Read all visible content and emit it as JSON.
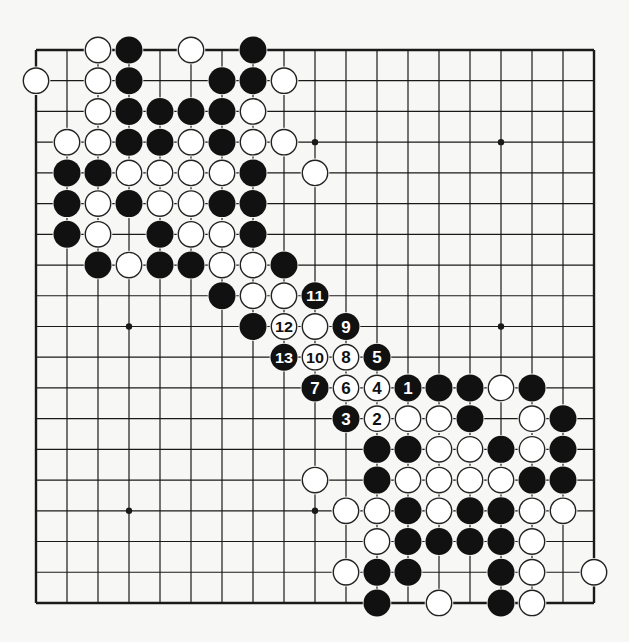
{
  "diagram": {
    "type": "go-board",
    "size": 19,
    "origin": {
      "x": 36,
      "y": 50
    },
    "spacing": {
      "x": 31.0,
      "y": 30.72
    },
    "stone_radius": 13.5,
    "colors": {
      "background": "#f7f7f5",
      "line": "#1a1a1a",
      "black_stone": "#111111",
      "white_stone": "#ffffff",
      "stone_outline": "#222222"
    },
    "star_points": [
      [
        3,
        3
      ],
      [
        9,
        3
      ],
      [
        15,
        3
      ],
      [
        3,
        9
      ],
      [
        9,
        9
      ],
      [
        15,
        9
      ],
      [
        3,
        15
      ],
      [
        9,
        15
      ],
      [
        15,
        15
      ]
    ],
    "stones": [
      {
        "c": 2,
        "r": 0,
        "color": "white"
      },
      {
        "c": 3,
        "r": 0,
        "color": "black"
      },
      {
        "c": 5,
        "r": 0,
        "color": "white"
      },
      {
        "c": 7,
        "r": 0,
        "color": "black"
      },
      {
        "c": 0,
        "r": 1,
        "color": "white"
      },
      {
        "c": 2,
        "r": 1,
        "color": "white"
      },
      {
        "c": 3,
        "r": 1,
        "color": "black"
      },
      {
        "c": 6,
        "r": 1,
        "color": "black"
      },
      {
        "c": 7,
        "r": 1,
        "color": "black"
      },
      {
        "c": 8,
        "r": 1,
        "color": "white"
      },
      {
        "c": 2,
        "r": 2,
        "color": "white"
      },
      {
        "c": 3,
        "r": 2,
        "color": "black"
      },
      {
        "c": 4,
        "r": 2,
        "color": "black"
      },
      {
        "c": 5,
        "r": 2,
        "color": "black"
      },
      {
        "c": 6,
        "r": 2,
        "color": "black"
      },
      {
        "c": 7,
        "r": 2,
        "color": "white"
      },
      {
        "c": 1,
        "r": 3,
        "color": "white"
      },
      {
        "c": 2,
        "r": 3,
        "color": "white"
      },
      {
        "c": 3,
        "r": 3,
        "color": "black"
      },
      {
        "c": 4,
        "r": 3,
        "color": "black"
      },
      {
        "c": 5,
        "r": 3,
        "color": "white"
      },
      {
        "c": 6,
        "r": 3,
        "color": "black"
      },
      {
        "c": 7,
        "r": 3,
        "color": "white"
      },
      {
        "c": 8,
        "r": 3,
        "color": "white"
      },
      {
        "c": 1,
        "r": 4,
        "color": "black"
      },
      {
        "c": 2,
        "r": 4,
        "color": "black"
      },
      {
        "c": 3,
        "r": 4,
        "color": "white"
      },
      {
        "c": 4,
        "r": 4,
        "color": "white"
      },
      {
        "c": 5,
        "r": 4,
        "color": "white"
      },
      {
        "c": 6,
        "r": 4,
        "color": "white"
      },
      {
        "c": 7,
        "r": 4,
        "color": "black"
      },
      {
        "c": 9,
        "r": 4,
        "color": "white"
      },
      {
        "c": 1,
        "r": 5,
        "color": "black"
      },
      {
        "c": 2,
        "r": 5,
        "color": "white"
      },
      {
        "c": 3,
        "r": 5,
        "color": "black"
      },
      {
        "c": 4,
        "r": 5,
        "color": "white"
      },
      {
        "c": 5,
        "r": 5,
        "color": "white"
      },
      {
        "c": 6,
        "r": 5,
        "color": "black"
      },
      {
        "c": 7,
        "r": 5,
        "color": "black"
      },
      {
        "c": 1,
        "r": 6,
        "color": "black"
      },
      {
        "c": 2,
        "r": 6,
        "color": "white"
      },
      {
        "c": 4,
        "r": 6,
        "color": "black"
      },
      {
        "c": 5,
        "r": 6,
        "color": "white"
      },
      {
        "c": 6,
        "r": 6,
        "color": "white"
      },
      {
        "c": 7,
        "r": 6,
        "color": "black"
      },
      {
        "c": 2,
        "r": 7,
        "color": "black"
      },
      {
        "c": 3,
        "r": 7,
        "color": "white"
      },
      {
        "c": 4,
        "r": 7,
        "color": "black"
      },
      {
        "c": 5,
        "r": 7,
        "color": "black"
      },
      {
        "c": 6,
        "r": 7,
        "color": "white"
      },
      {
        "c": 7,
        "r": 7,
        "color": "white"
      },
      {
        "c": 8,
        "r": 7,
        "color": "black"
      },
      {
        "c": 6,
        "r": 8,
        "color": "black"
      },
      {
        "c": 7,
        "r": 8,
        "color": "white"
      },
      {
        "c": 8,
        "r": 8,
        "color": "white"
      },
      {
        "c": 9,
        "r": 8,
        "color": "black",
        "label": "11"
      },
      {
        "c": 7,
        "r": 9,
        "color": "black"
      },
      {
        "c": 8,
        "r": 9,
        "color": "white",
        "label": "12"
      },
      {
        "c": 9,
        "r": 9,
        "color": "white"
      },
      {
        "c": 10,
        "r": 9,
        "color": "black",
        "label": "9"
      },
      {
        "c": 8,
        "r": 10,
        "color": "black",
        "label": "13"
      },
      {
        "c": 9,
        "r": 10,
        "color": "white",
        "label": "10"
      },
      {
        "c": 10,
        "r": 10,
        "color": "white",
        "label": "8"
      },
      {
        "c": 11,
        "r": 10,
        "color": "black",
        "label": "5"
      },
      {
        "c": 9,
        "r": 11,
        "color": "black",
        "label": "7"
      },
      {
        "c": 10,
        "r": 11,
        "color": "white",
        "label": "6"
      },
      {
        "c": 11,
        "r": 11,
        "color": "white",
        "label": "4"
      },
      {
        "c": 12,
        "r": 11,
        "color": "black",
        "label": "1"
      },
      {
        "c": 13,
        "r": 11,
        "color": "black"
      },
      {
        "c": 14,
        "r": 11,
        "color": "black"
      },
      {
        "c": 15,
        "r": 11,
        "color": "white"
      },
      {
        "c": 16,
        "r": 11,
        "color": "black"
      },
      {
        "c": 10,
        "r": 12,
        "color": "black",
        "label": "3"
      },
      {
        "c": 11,
        "r": 12,
        "color": "white",
        "label": "2"
      },
      {
        "c": 12,
        "r": 12,
        "color": "white"
      },
      {
        "c": 13,
        "r": 12,
        "color": "white"
      },
      {
        "c": 14,
        "r": 12,
        "color": "black"
      },
      {
        "c": 16,
        "r": 12,
        "color": "white"
      },
      {
        "c": 17,
        "r": 12,
        "color": "black"
      },
      {
        "c": 11,
        "r": 13,
        "color": "black"
      },
      {
        "c": 12,
        "r": 13,
        "color": "black"
      },
      {
        "c": 13,
        "r": 13,
        "color": "white"
      },
      {
        "c": 14,
        "r": 13,
        "color": "white"
      },
      {
        "c": 15,
        "r": 13,
        "color": "black"
      },
      {
        "c": 16,
        "r": 13,
        "color": "white"
      },
      {
        "c": 17,
        "r": 13,
        "color": "black"
      },
      {
        "c": 9,
        "r": 14,
        "color": "white"
      },
      {
        "c": 11,
        "r": 14,
        "color": "black"
      },
      {
        "c": 12,
        "r": 14,
        "color": "white"
      },
      {
        "c": 13,
        "r": 14,
        "color": "white"
      },
      {
        "c": 14,
        "r": 14,
        "color": "white"
      },
      {
        "c": 15,
        "r": 14,
        "color": "white"
      },
      {
        "c": 16,
        "r": 14,
        "color": "black"
      },
      {
        "c": 17,
        "r": 14,
        "color": "black"
      },
      {
        "c": 10,
        "r": 15,
        "color": "white"
      },
      {
        "c": 11,
        "r": 15,
        "color": "white"
      },
      {
        "c": 12,
        "r": 15,
        "color": "black"
      },
      {
        "c": 13,
        "r": 15,
        "color": "white"
      },
      {
        "c": 14,
        "r": 15,
        "color": "black"
      },
      {
        "c": 15,
        "r": 15,
        "color": "black"
      },
      {
        "c": 16,
        "r": 15,
        "color": "white"
      },
      {
        "c": 17,
        "r": 15,
        "color": "white"
      },
      {
        "c": 11,
        "r": 16,
        "color": "white"
      },
      {
        "c": 12,
        "r": 16,
        "color": "black"
      },
      {
        "c": 13,
        "r": 16,
        "color": "black"
      },
      {
        "c": 14,
        "r": 16,
        "color": "black"
      },
      {
        "c": 15,
        "r": 16,
        "color": "black"
      },
      {
        "c": 16,
        "r": 16,
        "color": "white"
      },
      {
        "c": 10,
        "r": 17,
        "color": "white"
      },
      {
        "c": 11,
        "r": 17,
        "color": "black"
      },
      {
        "c": 12,
        "r": 17,
        "color": "black"
      },
      {
        "c": 15,
        "r": 17,
        "color": "black"
      },
      {
        "c": 16,
        "r": 17,
        "color": "white"
      },
      {
        "c": 18,
        "r": 17,
        "color": "white"
      },
      {
        "c": 11,
        "r": 18,
        "color": "black"
      },
      {
        "c": 13,
        "r": 18,
        "color": "white"
      },
      {
        "c": 15,
        "r": 18,
        "color": "black"
      },
      {
        "c": 16,
        "r": 18,
        "color": "white"
      }
    ]
  }
}
